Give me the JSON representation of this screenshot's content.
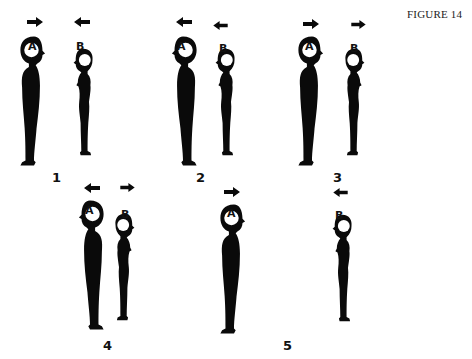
{
  "title": "FIGURE 14",
  "panels": [
    {
      "number": "1",
      "A": {
        "label": "A",
        "facing": "right",
        "arrow": "right"
      },
      "B": {
        "label": "B",
        "facing": "left",
        "arrow": "left"
      }
    },
    {
      "number": "2",
      "A": {
        "label": "A",
        "facing": "left",
        "arrow": "left"
      },
      "B": {
        "label": "B",
        "facing": "left",
        "arrow": "left"
      }
    },
    {
      "number": "3",
      "A": {
        "label": "A",
        "facing": "right",
        "arrow": "right"
      },
      "B": {
        "label": "B",
        "facing": "right",
        "arrow": "right"
      }
    },
    {
      "number": "4",
      "A": {
        "label": "A",
        "facing": "left",
        "arrow": "left"
      },
      "B": {
        "label": "B",
        "facing": "right",
        "arrow": "right"
      }
    },
    {
      "number": "5",
      "A": {
        "label": "A",
        "facing": "right",
        "arrow": "right"
      },
      "B": {
        "label": "B",
        "facing": "left",
        "arrow": "left"
      }
    }
  ],
  "colors": {
    "figure": "#0a0a0a",
    "background": "#ffffff"
  }
}
